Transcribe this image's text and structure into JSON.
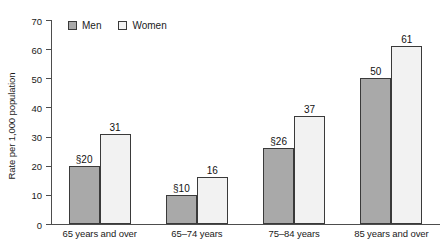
{
  "chart_data": {
    "type": "bar",
    "title": "",
    "subtitle": "",
    "xlabel": "",
    "ylabel": "Rate per 1,000 population",
    "ylim": [
      0,
      70
    ],
    "ytick_step": 10,
    "yticks": [
      "70",
      "60",
      "50",
      "40",
      "30",
      "20",
      "10",
      "0"
    ],
    "grid": false,
    "legend_position": "top-left-inside",
    "categories": [
      "65 years and over",
      "65–74 years",
      "75–84 years",
      "85 years and over"
    ],
    "series": [
      {
        "name": "Men",
        "color": "#a9a9a9",
        "values": [
          20,
          10,
          26,
          50
        ],
        "labels": [
          "§20",
          "§10",
          "§26",
          "50"
        ]
      },
      {
        "name": "Women",
        "color": "#f2f2f2",
        "values": [
          31,
          16,
          37,
          61
        ],
        "labels": [
          "31",
          "16",
          "37",
          "61"
        ]
      }
    ],
    "annotations": {
      "footnote_marker": "§",
      "footnote_marker_applies_to": [
        "Men 65 years and over",
        "Men 65–74 years",
        "Men 75–84 years"
      ]
    }
  },
  "legend": {
    "items": [
      {
        "label": "Men",
        "swatch_color": "#a9a9a9"
      },
      {
        "label": "Women",
        "swatch_color": "#f2f2f2"
      }
    ]
  },
  "colors": {
    "men_fill": "#a9a9a9",
    "women_fill": "#f2f2f2",
    "bar_outline": "#3a3a3a",
    "axis": "#4d4d4d",
    "text": "#1a1a1a",
    "background": "#ffffff"
  }
}
